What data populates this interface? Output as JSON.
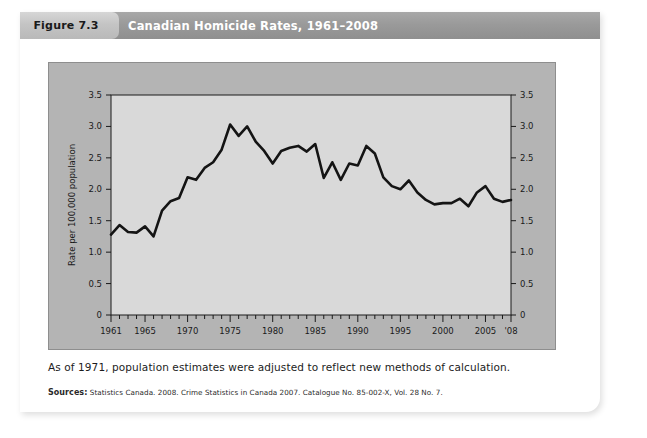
{
  "figure": {
    "number_label": "Figure 7.3",
    "title": "Canadian Homicide Rates, 1961–2008",
    "note": "As of 1971, population estimates were adjusted to reflect new methods of calculation.",
    "source_label": "Sources:",
    "source_text": "Statistics Canada. 2008. Crime Statistics in Canada 2007. Catalogue No. 85-002-X, Vol. 28 No. 7."
  },
  "colors": {
    "tab_gray": "#c4c4c4",
    "title_bar_gray": "#9a9a9a",
    "panel_gray": "#b4b4b4",
    "plot_background": "#d9d9d9",
    "line_black": "#141414",
    "axis_black": "#1a1a1a",
    "card_white": "#ffffff"
  },
  "chart_data": {
    "type": "line",
    "title": "Canadian Homicide Rates, 1961–2008",
    "xlabel": "",
    "ylabel": "Rate per 100,000 population",
    "xlim": [
      1961,
      2008
    ],
    "ylim": [
      0,
      3.5
    ],
    "grid": false,
    "legend": null,
    "y_ticks": [
      0,
      0.5,
      1.0,
      1.5,
      2.0,
      2.5,
      3.0,
      3.5
    ],
    "y_tick_labels": [
      "0",
      "0.5",
      "1.0",
      "1.5",
      "2.0",
      "2.5",
      "3.0",
      "3.5"
    ],
    "y_axis_duplicated_right": true,
    "x_tick_years": [
      1961,
      1962,
      1963,
      1964,
      1965,
      1966,
      1967,
      1968,
      1969,
      1970,
      1971,
      1972,
      1973,
      1974,
      1975,
      1976,
      1977,
      1978,
      1979,
      1980,
      1981,
      1982,
      1983,
      1984,
      1985,
      1986,
      1987,
      1988,
      1989,
      1990,
      1991,
      1992,
      1993,
      1994,
      1995,
      1996,
      1997,
      1998,
      1999,
      2000,
      2001,
      2002,
      2003,
      2004,
      2005,
      2006,
      2007,
      2008
    ],
    "x_labeled_ticks": [
      {
        "year": 1961,
        "label": "1961"
      },
      {
        "year": 1965,
        "label": "1965"
      },
      {
        "year": 1970,
        "label": "1970"
      },
      {
        "year": 1975,
        "label": "1975"
      },
      {
        "year": 1980,
        "label": "1980"
      },
      {
        "year": 1985,
        "label": "1985"
      },
      {
        "year": 1990,
        "label": "1990"
      },
      {
        "year": 1995,
        "label": "1995"
      },
      {
        "year": 2000,
        "label": "2000"
      },
      {
        "year": 2005,
        "label": "2005"
      },
      {
        "year": 2008,
        "label": "'08"
      }
    ],
    "series": [
      {
        "name": "Homicide rate per 100,000 population",
        "x": [
          1961,
          1962,
          1963,
          1964,
          1965,
          1966,
          1967,
          1968,
          1969,
          1970,
          1971,
          1972,
          1973,
          1974,
          1975,
          1976,
          1977,
          1978,
          1979,
          1980,
          1981,
          1982,
          1983,
          1984,
          1985,
          1986,
          1987,
          1988,
          1989,
          1990,
          1991,
          1992,
          1993,
          1994,
          1995,
          1996,
          1997,
          1998,
          1999,
          2000,
          2001,
          2002,
          2003,
          2004,
          2005,
          2006,
          2007,
          2008
        ],
        "values": [
          1.28,
          1.43,
          1.32,
          1.31,
          1.41,
          1.25,
          1.66,
          1.81,
          1.86,
          2.19,
          2.15,
          2.34,
          2.43,
          2.63,
          3.03,
          2.85,
          3.0,
          2.76,
          2.61,
          2.41,
          2.61,
          2.66,
          2.69,
          2.6,
          2.72,
          2.18,
          2.43,
          2.15,
          2.41,
          2.38,
          2.69,
          2.57,
          2.19,
          2.05,
          2.0,
          2.14,
          1.95,
          1.83,
          1.76,
          1.78,
          1.78,
          1.85,
          1.73,
          1.95,
          2.05,
          1.85,
          1.8,
          1.83
        ]
      }
    ]
  },
  "axis_labels": {
    "y_axis_title": "Rate per 100,000 population"
  }
}
